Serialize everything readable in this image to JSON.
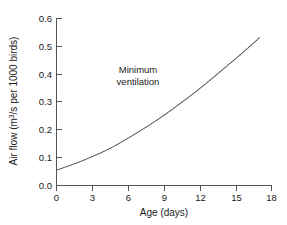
{
  "chart_data": {
    "type": "line",
    "title": "",
    "xlabel": "Age (days)",
    "ylabel": "Air flow (m³/s per 1000 birds)",
    "ylabel_parts": {
      "pre": "Air flow (m",
      "sup": "3",
      "post": "/s per 1000 birds)"
    },
    "xlim": [
      0,
      18
    ],
    "ylim": [
      0.0,
      0.6
    ],
    "xticks": [
      0,
      3,
      6,
      9,
      12,
      15,
      18
    ],
    "xtick_labels": [
      "0",
      "3",
      "6",
      "9",
      "12",
      "15",
      "18"
    ],
    "yticks": [
      0.0,
      0.1,
      0.2,
      0.3,
      0.4,
      0.5,
      0.6
    ],
    "ytick_labels": [
      "0.0",
      "0.1",
      "0.2",
      "0.3",
      "0.4",
      "0.5",
      "0.6"
    ],
    "grid": false,
    "legend": null,
    "series": [
      {
        "name": "Minimum ventilation",
        "style": "dotted",
        "color": "#4a4a4a",
        "x": [
          0,
          1,
          2,
          3,
          4,
          5,
          6,
          7,
          8,
          9,
          10,
          11,
          12,
          13,
          14,
          15,
          16,
          17
        ],
        "values": [
          0.055,
          0.07,
          0.086,
          0.104,
          0.123,
          0.145,
          0.17,
          0.196,
          0.223,
          0.252,
          0.283,
          0.315,
          0.348,
          0.383,
          0.419,
          0.455,
          0.492,
          0.53
        ]
      }
    ],
    "annotations": [
      {
        "name": "minimum-ventilation-label",
        "line1": "Minimum",
        "line2": "ventilation",
        "x": 7.6,
        "y": 0.42
      }
    ]
  },
  "colors": {
    "background": "#ffffff",
    "axis": "#555555",
    "curve": "#4a4a4a",
    "text": "#1a1a1a"
  }
}
